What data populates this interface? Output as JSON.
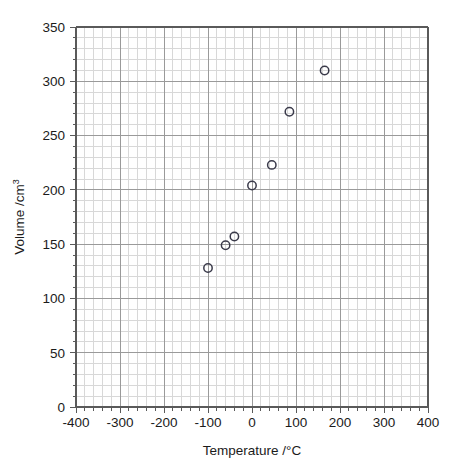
{
  "chart_data": {
    "type": "scatter",
    "title": "",
    "xlabel": "Temperature /°C",
    "ylabel": "Volume /cm³",
    "ylabel_base": "Volume /cm",
    "ylabel_exponent": "3",
    "xlim": [
      -400,
      400
    ],
    "ylim": [
      0,
      350
    ],
    "x_ticks": [
      -400,
      -300,
      -200,
      -100,
      0,
      100,
      200,
      300,
      400
    ],
    "x_tick_labels": [
      "-400",
      "-300",
      "-200",
      "-100",
      "0",
      "100",
      "200",
      "300",
      "400"
    ],
    "y_ticks": [
      0,
      50,
      100,
      150,
      200,
      250,
      300,
      350
    ],
    "y_tick_labels": [
      "0",
      "50",
      "100",
      "150",
      "200",
      "250",
      "300",
      "350"
    ],
    "x_minor_step": 20,
    "y_minor_step": 10,
    "grid": true,
    "grid_major_color": "#9a9a9a",
    "grid_minor_color": "#d8d8d8",
    "axis_color": "#5a5a5a",
    "marker": "open-circle",
    "marker_color": "#3a3a4a",
    "marker_radius": 4.2,
    "legend": null,
    "points": [
      {
        "x": -100,
        "y": 128
      },
      {
        "x": -60,
        "y": 149
      },
      {
        "x": -40,
        "y": 157
      },
      {
        "x": 0,
        "y": 204
      },
      {
        "x": 45,
        "y": 223
      },
      {
        "x": 85,
        "y": 272
      },
      {
        "x": 165,
        "y": 310
      }
    ],
    "x": [
      -100,
      -60,
      -40,
      0,
      45,
      85,
      165
    ],
    "values": [
      128,
      149,
      157,
      204,
      223,
      272,
      310
    ]
  },
  "plot_geometry": {
    "left": 76,
    "right": 428,
    "top": 27,
    "bottom": 407
  }
}
